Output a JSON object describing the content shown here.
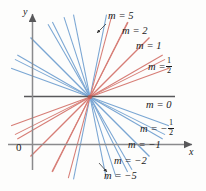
{
  "figure": {
    "background_color": "#fdfdfc",
    "axis_color": "#58585a",
    "positive_slope_color": "#d4736b",
    "negative_slope_color": "#6f9fd0",
    "text_color": "#1a1a1a",
    "axes": {
      "y_label": "y",
      "x_label": "x",
      "origin_label": "0",
      "x_axis_y": 144,
      "y_axis_x": 32,
      "arrowheads": [
        "y-axis-top",
        "x-axis-right"
      ]
    },
    "pencil_point": {
      "x": 90,
      "y": 97
    }
  },
  "chart_data": {
    "type": "line",
    "title": "",
    "xlabel": "x",
    "ylabel": "y",
    "grid": false,
    "legend": "inline-labels",
    "common_point": {
      "x": 90,
      "y": 97
    },
    "series": [
      {
        "name": "m = 5",
        "slope": 5,
        "color": "#6f9fd0",
        "label": "m = 5",
        "label_x": 104,
        "label_y": 16,
        "pointer": true
      },
      {
        "name": "m = 2",
        "slope": 2,
        "color": "#d4736b",
        "label": "m = 2",
        "label_x": 118,
        "label_y": 30,
        "pointer": false
      },
      {
        "name": "m = 1",
        "slope": 1,
        "color": "#d4736b",
        "label": "m = 1",
        "label_x": 133,
        "label_y": 45,
        "pointer": false
      },
      {
        "name": "m = 1/2",
        "slope": 0.5,
        "color": "#d4736b",
        "label": "m =",
        "label_x": 145,
        "label_y": 62,
        "fraction": {
          "numerator": "1",
          "denominator": "2"
        },
        "pointer": false
      },
      {
        "name": "m = 0",
        "slope": 0,
        "color": "#58585a",
        "label": "m = 0",
        "label_x": 143,
        "label_y": 100,
        "pointer": false
      },
      {
        "name": "m = -1/2",
        "slope": -0.5,
        "color": "#6f9fd0",
        "label": "m = −",
        "label_x": 140,
        "label_y": 123,
        "fraction": {
          "numerator": "1",
          "denominator": "2"
        },
        "pointer": false
      },
      {
        "name": "m = -1",
        "slope": -1,
        "color": "#6f9fd0",
        "label": "m = −1",
        "label_x": 127,
        "label_y": 142,
        "pointer": false
      },
      {
        "name": "m = -2",
        "slope": -2,
        "color": "#6f9fd0",
        "label": "m = −2",
        "label_x": 112,
        "label_y": 158,
        "pointer": false
      },
      {
        "name": "m = -5",
        "slope": -5,
        "color": "#6f9fd0",
        "label": "m = −5",
        "label_x": 103,
        "label_y": 172,
        "pointer": true
      }
    ],
    "unlabeled_rays": [
      {
        "angle_deg": 150,
        "color": "#6f9fd0"
      },
      {
        "angle_deg": 160,
        "color": "#6f9fd0"
      },
      {
        "angle_deg": 135,
        "color": "#6f9fd0"
      },
      {
        "angle_deg": 120,
        "color": "#6f9fd0"
      },
      {
        "angle_deg": 108,
        "color": "#6f9fd0"
      },
      {
        "angle_deg": 30,
        "color": "#d4736b"
      },
      {
        "angle_deg": 20,
        "color": "#d4736b"
      },
      {
        "angle_deg": 45,
        "color": "#d4736b"
      },
      {
        "angle_deg": 63,
        "color": "#d4736b"
      },
      {
        "angle_deg": 75,
        "color": "#d4736b"
      }
    ]
  }
}
